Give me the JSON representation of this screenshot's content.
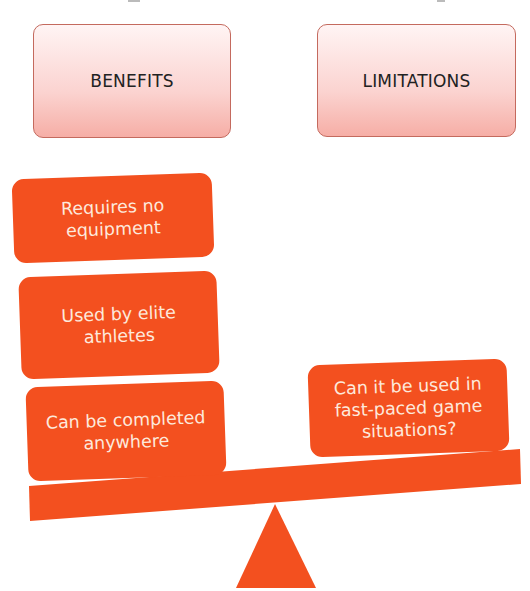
{
  "diagram": {
    "type": "balance-scale",
    "headers": {
      "benefits": "BENEFITS",
      "limitations": "LIMITATIONS"
    },
    "benefits": [
      "Requires no equipment",
      "Used by elite athletes",
      "Can be completed anywhere"
    ],
    "limitations": [
      "Can it be used in fast-paced game situations?"
    ],
    "colors": {
      "tile": "#f3501f",
      "tile_text": "#fde9dc",
      "header_border": "#c46a5e",
      "header_fill_top": "#fff4f4",
      "header_fill_bottom": "#f6aea6",
      "beam": "#f3501f",
      "fulcrum": "#f3501f"
    }
  }
}
